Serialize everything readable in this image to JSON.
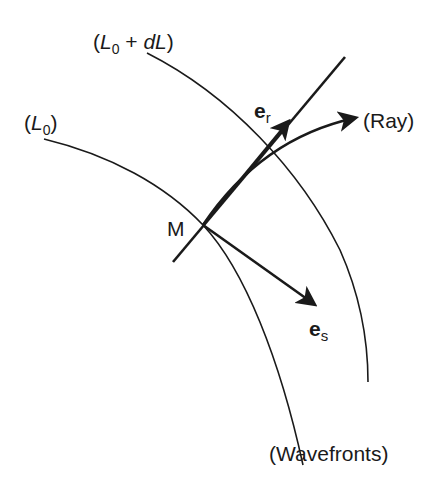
{
  "diagram": {
    "labels": {
      "wavefront_outer": {
        "open": "(",
        "var": "L",
        "sub": "0",
        "plus": " + ",
        "dvar": "dL",
        "close": ")"
      },
      "wavefront_inner": {
        "open": "(",
        "var": "L",
        "sub": "0",
        "close": ")"
      },
      "point": "M",
      "ray": "(Ray)",
      "wavefronts": "(Wavefronts)",
      "unit_ray": {
        "base": "e",
        "sub": "r"
      },
      "unit_s": {
        "base": "e",
        "sub": "s"
      }
    },
    "colors": {
      "stroke": "#1a1a1a",
      "background": "#ffffff"
    }
  }
}
